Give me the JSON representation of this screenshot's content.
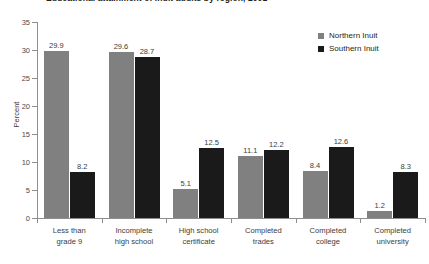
{
  "chart_data": {
    "type": "bar",
    "title": "Educational attainment of Inuit adults by region, 2001",
    "xlabel": "",
    "ylabel": "Percent",
    "ylim": [
      0,
      35
    ],
    "ytick_step": 5,
    "yticks": [
      "0",
      "5",
      "10",
      "15",
      "20",
      "25",
      "30",
      "35"
    ],
    "grid": false,
    "legend_position": "top-right",
    "categories": [
      "Less than\ngrade 9",
      "Incomplete\nhigh school",
      "High school\ncertificate",
      "Completed\ntrades",
      "Completed\ncollege",
      "Completed\nuniversity"
    ],
    "category_lines": [
      [
        "Less than",
        "grade 9"
      ],
      [
        "Incomplete",
        "high school"
      ],
      [
        "High school",
        "certificate"
      ],
      [
        "Completed",
        "trades"
      ],
      [
        "Completed",
        "college"
      ],
      [
        "Completed",
        "university"
      ]
    ],
    "series": [
      {
        "name": "Northern Inuit",
        "color": "#808080",
        "values": [
          29.9,
          29.6,
          5.1,
          11.1,
          8.4,
          1.2
        ],
        "labels": [
          "29.9",
          "29.6",
          "5.1",
          "11.1",
          "8.4",
          "1.2"
        ]
      },
      {
        "name": "Southern Inuit",
        "color": "#1a1a1a",
        "values": [
          8.2,
          28.7,
          12.5,
          12.2,
          12.6,
          8.3
        ],
        "labels": [
          "8.2",
          "28.7",
          "12.5",
          "12.2",
          "12.6",
          "8.3"
        ]
      }
    ]
  },
  "legend": {
    "items": [
      {
        "label": "Northern Inuit",
        "color": "#808080"
      },
      {
        "label": "Southern Inuit",
        "color": "#1a1a1a"
      }
    ]
  },
  "axis": {
    "y_title": "Percent"
  },
  "colors": {
    "series_northern": "#808080",
    "series_southern": "#1a1a1a",
    "axis_line": "#8d8d8d",
    "text": "#3c3c3b",
    "background": "#ffffff"
  }
}
